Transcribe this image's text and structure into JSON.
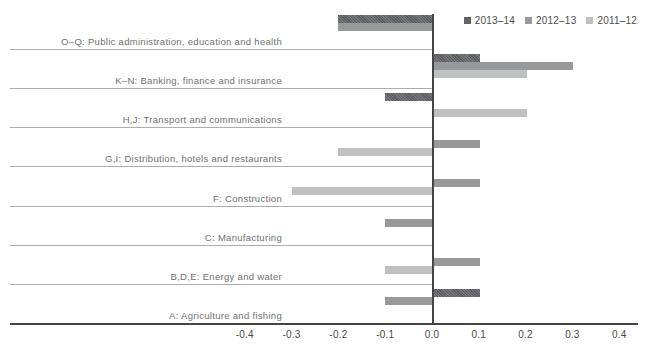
{
  "chart_data": {
    "type": "bar",
    "orientation": "horizontal",
    "title": "",
    "categories": [
      "O–Q: Public administration, education and health",
      "K–N: Banking, finance and insurance",
      "H,J: Transport and communications",
      "G,I: Distribution, hotels and restaurants",
      "F: Construction",
      "C: Manufacturing",
      "B,D,E: Energy and water",
      "A: Agriculture and fishing"
    ],
    "series": [
      {
        "name": "2013–14",
        "color": "#616265",
        "values": [
          -0.2,
          0.1,
          -0.1,
          0,
          0,
          0,
          0,
          0.1
        ]
      },
      {
        "name": "2012–13",
        "color": "#97999b",
        "values": [
          -0.2,
          0.3,
          0,
          0.1,
          0.1,
          -0.1,
          0.1,
          -0.1
        ]
      },
      {
        "name": "2011–12",
        "color": "#bfc0c2",
        "values": [
          0,
          0.2,
          0.2,
          -0.2,
          -0.3,
          0,
          -0.1,
          0
        ]
      }
    ],
    "xlim": [
      -0.4,
      0.4
    ],
    "x_ticks": [
      -0.4,
      -0.3,
      -0.2,
      -0.1,
      0,
      0.1,
      0.2,
      0.3,
      0.4
    ],
    "x_tick_labels": [
      "-0.4",
      "-0.3",
      "-0.2",
      "-0.1",
      "0.0",
      "0.1",
      "0.2",
      "0.3",
      "0.4"
    ],
    "legend_position": "top-right",
    "grid": false,
    "colors": {
      "axis": "#454545",
      "separator": "#adadad",
      "tick_text": "#4a4a4a",
      "category_text": "#6f7072",
      "legend_text": "#4d4d4d"
    }
  }
}
